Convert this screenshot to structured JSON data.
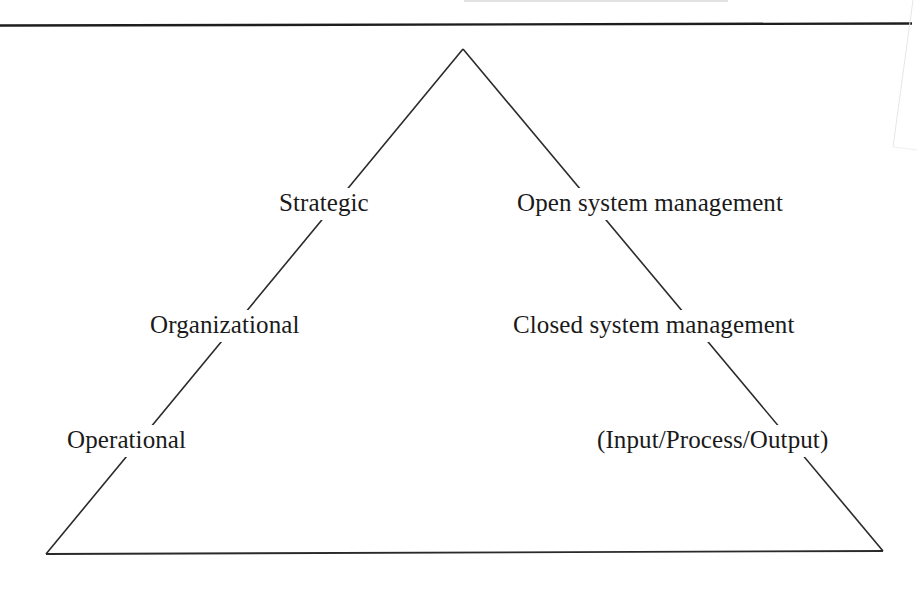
{
  "diagram": {
    "type": "pyramid",
    "colors": {
      "background": "#ffffff",
      "line": "#2a2a2a",
      "text": "#1a1a1a"
    },
    "left_labels": [
      {
        "id": "strategic",
        "text": "Strategic"
      },
      {
        "id": "organizational",
        "text": "Organizational"
      },
      {
        "id": "operational",
        "text": "Operational"
      }
    ],
    "right_labels": [
      {
        "id": "open-system",
        "text": "Open system management"
      },
      {
        "id": "closed-system",
        "text": "Closed system management"
      },
      {
        "id": "input-process-output",
        "text": "(Input/Process/Output)"
      }
    ]
  }
}
